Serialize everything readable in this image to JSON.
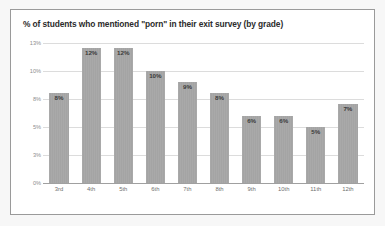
{
  "chart_data": {
    "type": "bar",
    "title": "% of students who mentioned \"porn\" in their exit survey (by grade)",
    "xlabel": "",
    "ylabel": "",
    "categories": [
      "3rd",
      "4th",
      "5th",
      "6th",
      "7th",
      "8th",
      "9th",
      "10th",
      "11th",
      "12th"
    ],
    "values": [
      8,
      12,
      12,
      10,
      9,
      8,
      6,
      6,
      5,
      7
    ],
    "value_labels": [
      "8%",
      "12%",
      "12%",
      "10%",
      "9%",
      "8%",
      "6%",
      "6%",
      "5%",
      "7%"
    ],
    "ylim": [
      0,
      13
    ],
    "yticks": [
      0,
      2.5,
      5,
      7.5,
      10,
      12.5
    ],
    "ytick_labels": [
      "0%",
      "3%",
      "5%",
      "8%",
      "10%",
      "13%"
    ],
    "grid": true,
    "legend": null,
    "series_color": "#a9a9a9",
    "gridline_color": "#dcdcdc",
    "axis_color": "#a0a0a0",
    "title_color": "#2b2b2b",
    "tick_label_color": "#8d8d8d",
    "value_label_color": "#3a3a3a",
    "background_color": "#ffffff",
    "border_color": "#9a9a9a"
  }
}
